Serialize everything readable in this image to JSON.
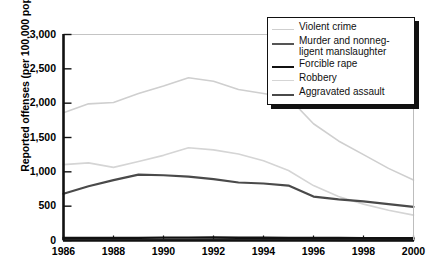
{
  "chart_data": {
    "type": "line",
    "title": "",
    "xlabel": "",
    "ylabel": "Reported offenses (per 100,000 population)",
    "xlim": [
      1986,
      2000
    ],
    "ylim": [
      0,
      3000
    ],
    "ytick_labels": [
      "3,000",
      "2,500",
      "2,000",
      "1,500",
      "1,000",
      "500",
      "0"
    ],
    "ytick_values": [
      3000,
      2500,
      2000,
      1500,
      1000,
      500,
      0
    ],
    "xtick_labels": [
      "1986",
      "1988",
      "1990",
      "1992",
      "1994",
      "1996",
      "1998",
      "2000"
    ],
    "xtick_values": [
      1986,
      1988,
      1990,
      1992,
      1994,
      1996,
      1998,
      2000
    ],
    "x": [
      1986,
      1987,
      1988,
      1989,
      1990,
      1991,
      1992,
      1993,
      1994,
      1995,
      1996,
      1997,
      1998,
      1999,
      2000
    ],
    "grid": false,
    "gridlines": [
      "top-3000"
    ],
    "legend_position": "top-right",
    "series": [
      {
        "name": "Violent crime",
        "color": "#cfcfcf",
        "width": 1.6,
        "values": [
          1860,
          1990,
          2010,
          2140,
          2250,
          2370,
          2320,
          2200,
          2140,
          2080,
          1700,
          1450,
          1250,
          1050,
          880
        ]
      },
      {
        "name": "Murder and nonneg-\nligent manslaughter",
        "label_line1": "Murder and nonneg-",
        "label_line2": "ligent manslaughter",
        "color": "#555555",
        "width": 2.2,
        "values": [
          8.6,
          8.3,
          8.4,
          8.7,
          9.4,
          9.8,
          9.3,
          9.5,
          9.0,
          8.2,
          7.4,
          6.8,
          6.3,
          5.7,
          5.5
        ]
      },
      {
        "name": "Forcible rape",
        "color": "#111111",
        "width": 2.4,
        "values": [
          38,
          37.6,
          37.8,
          38.3,
          41.2,
          42.3,
          42.8,
          41.1,
          39.3,
          37.1,
          36.3,
          35.9,
          34.5,
          32.8,
          32.0
        ]
      },
      {
        "name": "Robbery",
        "color": "#d5d5d5",
        "width": 1.6,
        "values": [
          1105,
          1130,
          1065,
          1150,
          1240,
          1350,
          1320,
          1260,
          1160,
          1020,
          800,
          640,
          530,
          440,
          370
        ]
      },
      {
        "name": "Aggravated assault",
        "color": "#4a4a4a",
        "width": 2.2,
        "values": [
          680,
          790,
          880,
          960,
          950,
          930,
          895,
          845,
          830,
          800,
          640,
          600,
          570,
          530,
          490
        ]
      }
    ]
  }
}
